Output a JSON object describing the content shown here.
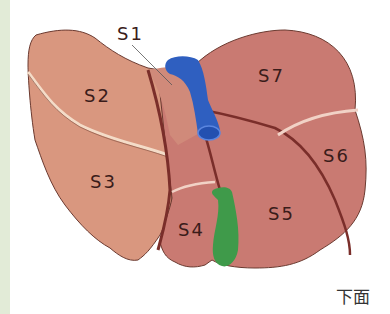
{
  "figure": {
    "view_caption": "下面",
    "segments": [
      {
        "id": "S1",
        "label": "S1"
      },
      {
        "id": "S2",
        "label": "S2"
      },
      {
        "id": "S3",
        "label": "S3"
      },
      {
        "id": "S4",
        "label": "S4"
      },
      {
        "id": "S5",
        "label": "S5"
      },
      {
        "id": "S6",
        "label": "S6"
      },
      {
        "id": "S7",
        "label": "S7"
      }
    ],
    "colors": {
      "left_lobe": "#d9977f",
      "right_lobe": "#c97a72",
      "caudate": "#d08a7a",
      "ivc": "#2f5fc0",
      "gallbladder": "#3f9a4a",
      "border": "#6b2f2a",
      "strip": "#e2ebd7"
    }
  }
}
